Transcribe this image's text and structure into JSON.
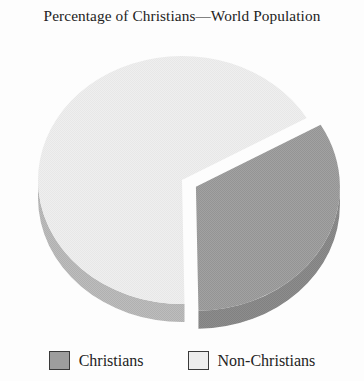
{
  "chart_data": {
    "type": "pie",
    "title": "Percentage of Christians—World Population",
    "xlabel": "",
    "ylabel": "",
    "legend_position": "bottom",
    "grid": false,
    "exploded": true,
    "three_d": true,
    "categories": [
      "Christians",
      "Non-Christians"
    ],
    "values": [
      33,
      67
    ],
    "slices": [
      {
        "label": "Christians",
        "value": 33,
        "color": "#9d9d9d",
        "side_color": "#888888",
        "exploded": true,
        "start_angle_deg": 330,
        "end_angle_deg": 449
      },
      {
        "label": "Non-Christians",
        "value": 67,
        "color": "#ededed",
        "side_color": "#b9b9b9",
        "exploded": false,
        "start_angle_deg": 89,
        "end_angle_deg": 330
      }
    ]
  },
  "legend": {
    "items": [
      {
        "label": "Christians",
        "color": "#9d9d9d"
      },
      {
        "label": "Non-Christians",
        "color": "#ededed"
      }
    ]
  },
  "colors": {
    "background": "#fdfdfd",
    "text": "#232323",
    "swatch_border": "#3a3a3a",
    "christians": "#9d9d9d",
    "non_christians": "#ededed"
  }
}
